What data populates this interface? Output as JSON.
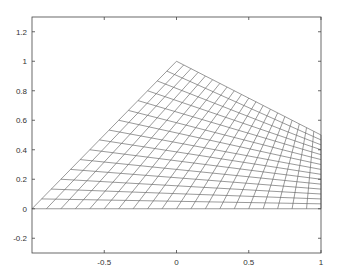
{
  "chart_data": {
    "type": "line",
    "title": "",
    "xlabel": "",
    "ylabel": "",
    "mesh": {
      "corners": [
        [
          -1,
          0
        ],
        [
          1,
          0
        ],
        [
          1,
          0.5
        ],
        [
          0,
          1
        ]
      ],
      "divisions_u": 20,
      "divisions_v": 15
    },
    "xlim": [
      -1,
      1
    ],
    "ylim": [
      -0.3,
      1.3
    ],
    "xticks": [
      -0.5,
      0,
      0.5,
      1
    ],
    "xtick_labels": [
      "-0.5",
      "0",
      "0.5",
      "1"
    ],
    "yticks": [
      -0.2,
      0,
      0.2,
      0.4,
      0.6,
      0.8,
      1,
      1.2
    ],
    "ytick_labels": [
      "-0.2",
      "0",
      "0.2",
      "0.4",
      "0.6",
      "0.8",
      "1",
      "1.2"
    ],
    "grid": false,
    "line_color": "#555555"
  }
}
